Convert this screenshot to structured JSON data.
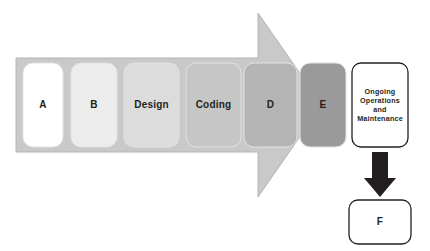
{
  "diagram": {
    "type": "process-arrow-flow",
    "background_color": "#ffffff",
    "arrow": {
      "name": "main-process-arrow",
      "fill_color": "#c9c9c9",
      "stroke_color": "#b0b0b0",
      "direction": "right"
    },
    "stages": [
      {
        "id": "stage-a",
        "label": "A",
        "fill_color": "#ffffff",
        "text_color": "#231f20",
        "order": 1,
        "label_style": "single"
      },
      {
        "id": "stage-b",
        "label": "B",
        "fill_color": "#ececec",
        "text_color": "#231f20",
        "order": 2,
        "label_style": "single"
      },
      {
        "id": "stage-design",
        "label": "Design",
        "fill_color": "#dcdcdc",
        "text_color": "#231f20",
        "order": 3,
        "label_style": "word"
      },
      {
        "id": "stage-coding",
        "label": "Coding",
        "fill_color": "#c6c6c6",
        "text_color": "#231f20",
        "order": 4,
        "label_style": "word"
      },
      {
        "id": "stage-d",
        "label": "D",
        "fill_color": "#b4b4b4",
        "text_color": "#231f20",
        "order": 5,
        "label_style": "single"
      },
      {
        "id": "stage-e",
        "label": "E",
        "fill_color": "#9a9a9a",
        "text_color": "#231f20",
        "order": 6,
        "label_style": "single"
      }
    ],
    "ongoing_box": {
      "id": "ongoing-operations-box",
      "label": "Ongoing\nOperations\nand\nMaintenance",
      "line1": "Ongoing",
      "line2": "Operations",
      "line3": "and",
      "line4": "Maintenance",
      "fill_color": "#ffffff",
      "stroke_color": "#231f20",
      "text_color": "#231f20"
    },
    "down_arrow": {
      "id": "down-arrow",
      "fill_color": "#231f20",
      "direction": "down"
    },
    "final_box": {
      "id": "final-box-f",
      "label": "F",
      "fill_color": "#ffffff",
      "stroke_color": "#231f20",
      "text_color": "#231f20"
    }
  }
}
